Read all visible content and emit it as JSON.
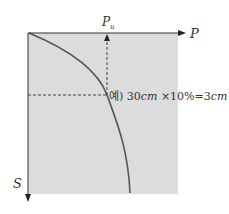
{
  "diagram": {
    "type": "pressure-settlement curve",
    "axes": {
      "x_label": "P",
      "y_label": "S",
      "marker_label": "P",
      "marker_subscript": "u"
    },
    "annotation": {
      "prefix": "예)",
      "value1": "30",
      "unit1": "cm",
      "times": "×",
      "value2": "10%",
      "equals": "=",
      "value3": "3",
      "unit3": "cm"
    },
    "colors": {
      "background_fill": "#dcdcdc",
      "curve": "#555555",
      "axis": "#333333",
      "dashed": "#444444"
    }
  }
}
